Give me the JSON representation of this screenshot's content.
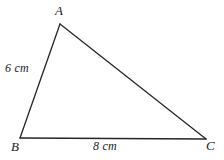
{
  "figure": {
    "background_color": "#ffffff",
    "stroke_color": "#262626",
    "stroke_width": 1.3,
    "canvas": {
      "width": 224,
      "height": 160
    },
    "vertices": [
      {
        "name": "A",
        "label": "A",
        "x": 60,
        "y": 24
      },
      {
        "name": "B",
        "label": "B",
        "x": 20,
        "y": 138
      },
      {
        "name": "C",
        "label": "C",
        "x": 206,
        "y": 139
      }
    ],
    "sides": [
      {
        "name": "side-ab",
        "from": "B",
        "to": "A",
        "label": "6 cm",
        "length": 6,
        "unit": "cm"
      },
      {
        "name": "side-bc",
        "from": "B",
        "to": "C",
        "label": "8 cm",
        "length": 8,
        "unit": "cm"
      },
      {
        "name": "side-ac",
        "from": "A",
        "to": "C",
        "label": "",
        "length": null,
        "unit": "cm"
      }
    ],
    "labels": {
      "vertex_a": "A",
      "vertex_b": "B",
      "vertex_c": "C",
      "side_ab": "6 cm",
      "side_bc": "8 cm"
    }
  }
}
